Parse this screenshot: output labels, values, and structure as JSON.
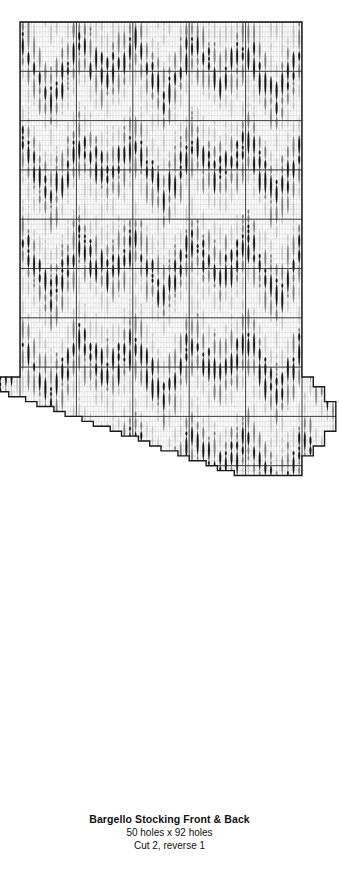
{
  "document": {
    "kind": "bargello-needlepoint-chart"
  },
  "caption": {
    "title": "Bargello Stocking Front & Back",
    "dimensions": "50 holes x 92 holes",
    "instruction": "Cut 2, reverse 1"
  },
  "colors": {
    "outline": "#1a1a1a",
    "grid_minor": "#c9c9c9",
    "grid_major": "#2b2b2b",
    "background": "#ffffff",
    "shade_dark": "#161616",
    "shade_mid": "#7d7d7d",
    "shade_light": "#c4c4c4",
    "shade_pale": "#e8e8e8"
  },
  "chart_data": {
    "type": "heatmap",
    "title": "Bargello Stocking Front & Back",
    "xlabel": "holes across",
    "ylabel": "holes down",
    "grid": true,
    "legend": "none",
    "cols": 50,
    "rows": 92,
    "major_grid_every": 10,
    "cell_w": 5.64,
    "cell_h": 4.93,
    "origin_x": 20,
    "origin_y": 22,
    "shades": [
      {
        "name": "dark",
        "hex": "#161616",
        "weight": 0.26
      },
      {
        "name": "mid",
        "hex": "#7d7d7d",
        "weight": 0.27
      },
      {
        "name": "light",
        "hex": "#c4c4c4",
        "weight": 0.25
      },
      {
        "name": "pale",
        "hex": "#e8e8e8",
        "weight": 0.22
      }
    ],
    "stitch_lengths": [
      1,
      2,
      3,
      4,
      5,
      6
    ],
    "wave_repeat_cols": 10,
    "wave_repeat_rows": 20,
    "outline_path": "leg rectangle 50x~115px wide body, foot flares left and right below row 72, heel bump right, staircase toe lower-left",
    "silhouette": {
      "leg_top_row": 0,
      "leg_bottom_row": 71,
      "foot_top_row": 72,
      "foot_bottom_row": 91,
      "left_extension_cols": 4,
      "right_heel_cols": 6
    }
  }
}
